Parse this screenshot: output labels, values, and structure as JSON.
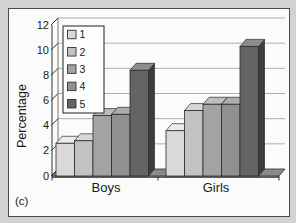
{
  "figure": {
    "caption": "(c)",
    "background_color": "#d2d2d2",
    "plot_background": "#fbfbfb",
    "frame_border_color": "#4a4a4a"
  },
  "chart_data": {
    "type": "bar",
    "style": "3d-column-grayscale",
    "title": "",
    "xlabel": "",
    "ylabel": "Percentage",
    "ylim": [
      0,
      12
    ],
    "ytick_step": 2,
    "grid": true,
    "categories": [
      "Boys",
      "Girls"
    ],
    "series": [
      {
        "name": "1",
        "values": [
          2.6,
          3.6
        ],
        "front_color": "#d9d9d9",
        "top_color": "#ececec",
        "side_color": "#ababab"
      },
      {
        "name": "2",
        "values": [
          2.8,
          5.2
        ],
        "front_color": "#c2c2c2",
        "top_color": "#d8d8d8",
        "side_color": "#939393"
      },
      {
        "name": "3",
        "values": [
          4.8,
          5.7
        ],
        "front_color": "#a3a3a3",
        "top_color": "#bdbdbd",
        "side_color": "#787878"
      },
      {
        "name": "4",
        "values": [
          4.9,
          5.7
        ],
        "front_color": "#909090",
        "top_color": "#adadad",
        "side_color": "#666666"
      },
      {
        "name": "5",
        "values": [
          8.4,
          10.3
        ],
        "front_color": "#646464",
        "top_color": "#8d8d8d",
        "side_color": "#3c3c3c"
      }
    ],
    "legend": {
      "position": "top-left-inside",
      "entries": [
        "1",
        "2",
        "3",
        "4",
        "5"
      ]
    },
    "axis_color": "#333333",
    "wall_edge_color": "#777777",
    "gridline_color": "#9a9a9a",
    "bar_outline_color": "#2b2b2b",
    "floor_color": "#8a8a8a",
    "floor_front_color": "#5e5e5e",
    "legend_box_color": "#fdfdfd",
    "legend_border_color": "#333333",
    "text_color": "#1a1a1a"
  }
}
